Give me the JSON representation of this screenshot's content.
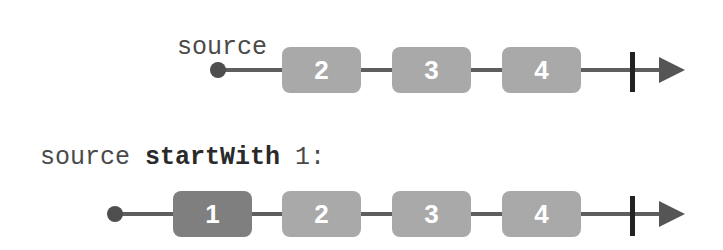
{
  "rows": [
    {
      "label_plain": "source",
      "items": [
        "2",
        "3",
        "4"
      ]
    },
    {
      "label_plain": "source ",
      "label_bold": "startWith",
      "label_tail": " 1:",
      "items": [
        "1",
        "2",
        "3",
        "4"
      ]
    }
  ],
  "colors": {
    "source_item": "#a9a9a9",
    "prepended_item": "#7f7f7f",
    "line": "#5e5e5e",
    "terminator": "#222222"
  }
}
